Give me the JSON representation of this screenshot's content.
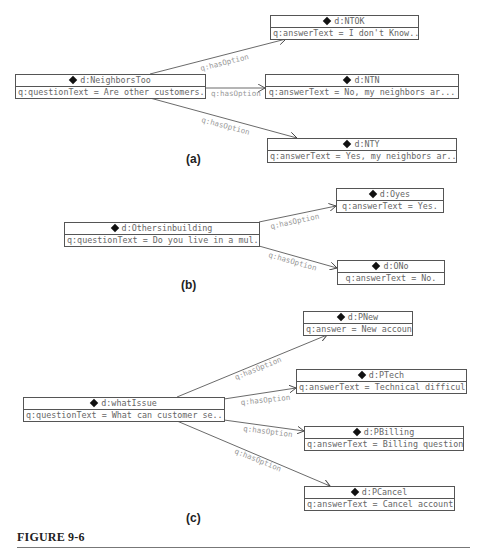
{
  "figure": {
    "caption": "FIGURE 9-6",
    "panels": [
      {
        "label": "(a)",
        "question": {
          "id": "d:NeighborsToo",
          "attr": "q:questionText = Are other customers..."
        },
        "options": [
          {
            "id": "d:NTOK",
            "attr": "q:answerText = I don't Know..."
          },
          {
            "id": "d:NTN",
            "attr": "q:answerText = No, my neighbors ar..."
          },
          {
            "id": "d:NTY",
            "attr": "q:answerText = Yes, my neighbors ar..."
          }
        ],
        "edge_label": "q:hasOption"
      },
      {
        "label": "(b)",
        "question": {
          "id": "d:Othersinbuilding",
          "attr": "q:questionText = Do you live in a mul..."
        },
        "options": [
          {
            "id": "d:Oyes",
            "attr": "q:answerText = Yes."
          },
          {
            "id": "d:ONo",
            "attr": "q:answerText = No."
          }
        ],
        "edge_label": "q:hasOption"
      },
      {
        "label": "(c)",
        "question": {
          "id": "d:whatIssue",
          "attr": "q:questionText = What can customer se..."
        },
        "options": [
          {
            "id": "d:PNew",
            "attr": "q:answer = New account"
          },
          {
            "id": "d:PTech",
            "attr": "q:answerText = Technical difficulty"
          },
          {
            "id": "d:PBilling",
            "attr": "q:answerText = Billing question."
          },
          {
            "id": "d:PCancel",
            "attr": "q:answerText = Cancel account"
          }
        ],
        "edge_label": "q:hasOption"
      }
    ]
  },
  "colors": {
    "border": "#555555",
    "text": "#666666",
    "edge": "#444444",
    "edge_label": "#999999",
    "diamond": "#111111"
  }
}
